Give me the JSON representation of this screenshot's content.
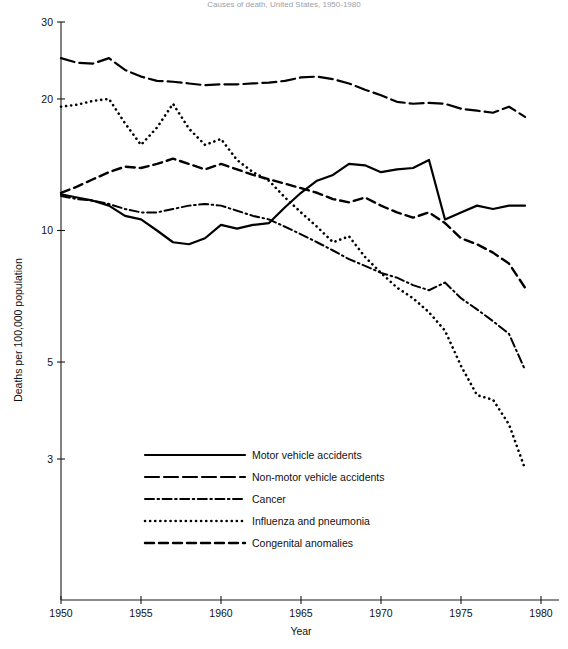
{
  "chart_data": {
    "type": "line",
    "title": "Causes of death, United States, 1950-1980",
    "xlabel": "Year",
    "ylabel": "Deaths per 100,000 population",
    "yscale": "log",
    "ylim": [
      2.6,
      31
    ],
    "xlim": [
      1950,
      1980
    ],
    "ytick_labels": [
      "30",
      "20",
      "10",
      "5",
      "3"
    ],
    "ytick_values": [
      30,
      20,
      10,
      5,
      3
    ],
    "xtick_labels": [
      "1950",
      "1955",
      "1960",
      "1965",
      "1970",
      "1975",
      "1980"
    ],
    "xtick_values": [
      1950,
      1955,
      1960,
      1965,
      1970,
      1975,
      1980
    ],
    "grid": false,
    "legend_position": "lower-left-inside",
    "x": [
      1950,
      1951,
      1952,
      1953,
      1954,
      1955,
      1956,
      1957,
      1958,
      1959,
      1960,
      1961,
      1962,
      1963,
      1964,
      1965,
      1966,
      1967,
      1968,
      1969,
      1970,
      1971,
      1972,
      1973,
      1974,
      1975,
      1976,
      1977,
      1978,
      1979
    ],
    "series": [
      {
        "name": "Motor vehicle accidents",
        "style": "solid",
        "values": [
          12.1,
          11.9,
          11.7,
          11.4,
          10.8,
          10.6,
          10.0,
          9.4,
          9.3,
          9.6,
          10.3,
          10.1,
          10.3,
          10.4,
          11.3,
          12.2,
          13.0,
          13.4,
          14.2,
          14.1,
          13.6,
          13.8,
          13.9,
          14.5,
          10.6,
          11.0,
          11.4,
          11.2,
          11.4,
          11.4
        ]
      },
      {
        "name": "Non-motor vehicle accidents",
        "style": "long-dash",
        "values": [
          24.8,
          24.2,
          24.1,
          24.8,
          23.3,
          22.5,
          22.0,
          21.9,
          21.7,
          21.5,
          21.6,
          21.6,
          21.7,
          21.8,
          22.0,
          22.4,
          22.5,
          22.2,
          21.7,
          21.0,
          20.4,
          19.7,
          19.5,
          19.6,
          19.5,
          19.0,
          18.8,
          18.6,
          19.2,
          18.2
        ]
      },
      {
        "name": "Cancer",
        "style": "dash-dot",
        "values": [
          12.0,
          11.8,
          11.7,
          11.5,
          11.2,
          11.0,
          11.0,
          11.2,
          11.4,
          11.5,
          11.4,
          11.1,
          10.8,
          10.6,
          10.2,
          9.8,
          9.4,
          9.0,
          8.6,
          8.3,
          8.0,
          7.8,
          7.5,
          7.3,
          7.6,
          7.0,
          6.6,
          6.2,
          5.8,
          4.8
        ]
      },
      {
        "name": "Influenza and pneumonia",
        "style": "dotted",
        "values": [
          19.2,
          19.4,
          19.8,
          20.0,
          17.6,
          15.7,
          17.2,
          19.5,
          17.1,
          15.7,
          16.2,
          14.5,
          13.6,
          13.0,
          11.9,
          11.0,
          10.2,
          9.4,
          9.7,
          8.7,
          8.0,
          7.4,
          7.0,
          6.5,
          5.9,
          4.9,
          4.2,
          4.1,
          3.6,
          2.85
        ]
      },
      {
        "name": "Congenital anomalies",
        "style": "medium-dash",
        "values": [
          12.2,
          12.6,
          13.1,
          13.6,
          14.0,
          13.9,
          14.2,
          14.6,
          14.2,
          13.8,
          14.2,
          13.8,
          13.4,
          13.1,
          12.8,
          12.5,
          12.2,
          11.8,
          11.6,
          11.9,
          11.4,
          11.0,
          10.7,
          11.0,
          10.4,
          9.6,
          9.3,
          8.9,
          8.4,
          7.4
        ]
      }
    ]
  },
  "legend": {
    "items": [
      {
        "label": "Motor vehicle accidents"
      },
      {
        "label": "Non-motor vehicle accidents"
      },
      {
        "label": "Cancer"
      },
      {
        "label": "Influenza and pneumonia"
      },
      {
        "label": "Congenital anomalies"
      }
    ]
  }
}
